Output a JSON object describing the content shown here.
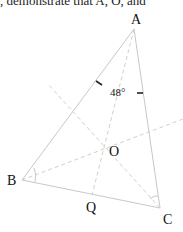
{
  "caption": ", demonstrate that A, O, and",
  "diagram": {
    "points": {
      "A": {
        "label": "A",
        "x": 134,
        "y": 29
      },
      "B": {
        "label": "B",
        "x": 22,
        "y": 180
      },
      "C": {
        "label": "C",
        "x": 160,
        "y": 208
      },
      "O": {
        "label": "O",
        "x": 106,
        "y": 148
      },
      "Q": {
        "label": "Q",
        "x": 92,
        "y": 195
      }
    },
    "angle_label": "48°",
    "colors": {
      "lines": "#c8c8c8",
      "dashed": "#d0d0d0",
      "text": "#111111",
      "arrows": "#222222"
    }
  }
}
